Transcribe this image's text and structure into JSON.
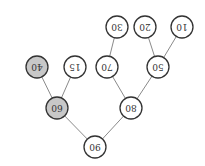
{
  "diagram": {
    "type": "binary-tree",
    "orientation": "rotated-180",
    "colors": {
      "default_fill": "#ffffff",
      "highlight_fill": "#c8c8c8",
      "stroke": "#333333",
      "edge": "#8a8a8a"
    },
    "nodes": [
      {
        "id": "n90",
        "label": "90",
        "x": 110,
        "y": 19,
        "highlight": false
      },
      {
        "id": "n80",
        "label": "80",
        "x": 74,
        "y": 58,
        "highlight": false
      },
      {
        "id": "n60",
        "label": "60",
        "x": 148,
        "y": 58,
        "highlight": true
      },
      {
        "id": "n50",
        "label": "50",
        "x": 47,
        "y": 99,
        "highlight": false
      },
      {
        "id": "n70",
        "label": "70",
        "x": 98,
        "y": 99,
        "highlight": false
      },
      {
        "id": "n15",
        "label": "15",
        "x": 130,
        "y": 99,
        "highlight": false
      },
      {
        "id": "n40",
        "label": "40",
        "x": 168,
        "y": 99,
        "highlight": true
      },
      {
        "id": "n10",
        "label": "10",
        "x": 23,
        "y": 139,
        "highlight": false
      },
      {
        "id": "n20",
        "label": "20",
        "x": 60,
        "y": 139,
        "highlight": false
      },
      {
        "id": "n30",
        "label": "30",
        "x": 88,
        "y": 139,
        "highlight": false
      }
    ],
    "edges": [
      {
        "from": "n90",
        "to": "n80"
      },
      {
        "from": "n90",
        "to": "n60"
      },
      {
        "from": "n80",
        "to": "n50"
      },
      {
        "from": "n80",
        "to": "n70"
      },
      {
        "from": "n60",
        "to": "n15"
      },
      {
        "from": "n60",
        "to": "n40"
      },
      {
        "from": "n50",
        "to": "n10"
      },
      {
        "from": "n50",
        "to": "n20"
      },
      {
        "from": "n70",
        "to": "n30"
      }
    ]
  }
}
